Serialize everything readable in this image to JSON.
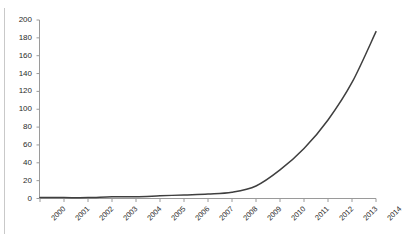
{
  "chart_data": {
    "type": "line",
    "title": "",
    "subtitle": "",
    "xlabel": "",
    "ylabel": "",
    "categories": [
      "2000",
      "2001",
      "2002",
      "2003",
      "2004",
      "2005",
      "2006",
      "2007",
      "2008",
      "2009",
      "2010",
      "2011",
      "2012",
      "2013",
      "2014"
    ],
    "x": [
      2000,
      2001,
      2002,
      2003,
      2004,
      2005,
      2006,
      2007,
      2008,
      2009,
      2010,
      2011,
      2012,
      2013,
      2014
    ],
    "values": [
      1,
      1,
      1,
      2,
      2,
      3,
      4,
      5,
      7,
      14,
      32,
      56,
      88,
      130,
      187
    ],
    "series": [
      {
        "name": "series-1",
        "values": [
          1,
          1,
          1,
          2,
          2,
          3,
          4,
          5,
          7,
          14,
          32,
          56,
          88,
          130,
          187
        ],
        "color": "#3f3f3f"
      }
    ],
    "ylim": [
      0,
      200
    ],
    "yticks": [
      0,
      20,
      40,
      60,
      80,
      100,
      120,
      140,
      160,
      180,
      200
    ],
    "ytick_labels": [
      "0",
      "20",
      "40",
      "60",
      "80",
      "100",
      "120",
      "140",
      "160",
      "180",
      "200"
    ],
    "xlim": [
      2000,
      2014
    ],
    "grid": false,
    "legend": false,
    "legend_position": "none",
    "annotations": []
  },
  "axes": {
    "y_axis_color": "#9a9a9a",
    "x_axis_color": "#9a9a9a",
    "tick_color": "#9a9a9a",
    "label_color": "#2b2b2b",
    "line_color": "#3f3f3f",
    "background": "#ffffff"
  }
}
